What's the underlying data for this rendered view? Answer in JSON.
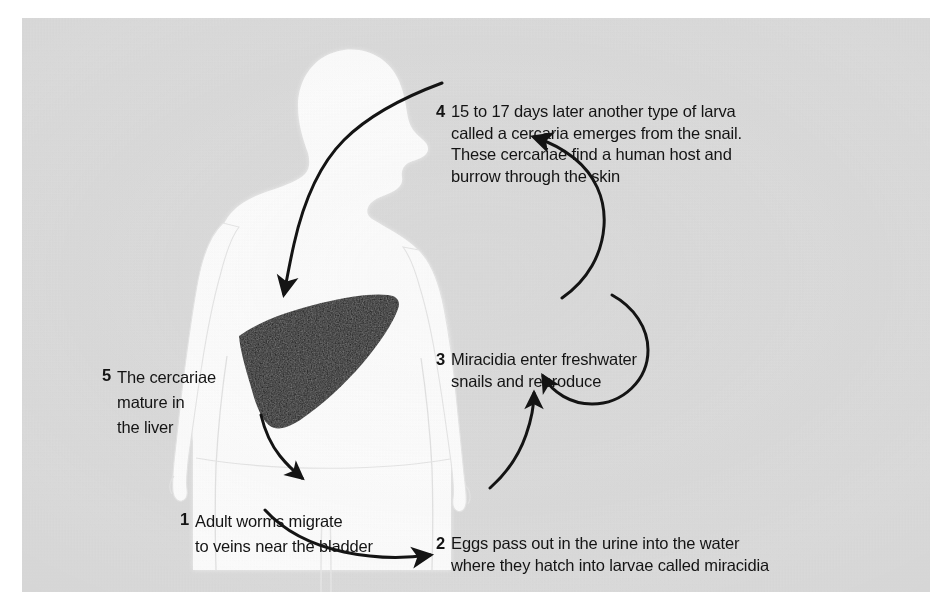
{
  "figure": {
    "background_color": "#ffffff",
    "panel_color": "#dcdcdc",
    "ink_color": "#141414",
    "silhouette_color": "#fdfdfd",
    "organ_color": "#111111"
  },
  "steps": [
    {
      "number": "1",
      "lines": [
        "Adult worms migrate",
        "to veins near the bladder"
      ],
      "text": "Adult worms migrate to veins near the bladder"
    },
    {
      "number": "2",
      "lines": [
        "Eggs pass out in the urine into the water",
        "where they hatch into larvae called miracidia"
      ],
      "text": "Eggs pass out in the urine into the water where they hatch into larvae called miracidia"
    },
    {
      "number": "3",
      "lines": [
        "Miracidia enter freshwater",
        "snails and reproduce"
      ],
      "text": "Miracidia enter freshwater snails and reproduce"
    },
    {
      "number": "4",
      "lines": [
        "15 to 17 days later another type of larva",
        "called a cercaria emerges from the snail.",
        "These cercariae find a human host and",
        "burrow through the skin"
      ],
      "text": "15 to 17 days later another type of larva called a cercaria emerges from the snail. These cercariae find a human host and burrow through the skin"
    },
    {
      "number": "5",
      "lines": [
        "The cercariae",
        "mature in",
        "the liver"
      ],
      "text": "The cercariae mature in the liver"
    }
  ],
  "artwork": {
    "human_silhouette": "human-body-profile-silhouette",
    "organ": "liver-shape",
    "arrows": [
      {
        "name": "arrow-skin-to-liver",
        "from_step": "4",
        "to_step": "5"
      },
      {
        "name": "arrow-liver-to-bladder",
        "from_step": "5",
        "to_step": "1"
      },
      {
        "name": "arrow-bladder-to-water",
        "from_step": "1",
        "to_step": "2"
      },
      {
        "name": "arrow-water-to-snail",
        "from_step": "2",
        "to_step": "3"
      },
      {
        "name": "arrow-snail-reproduce-loop",
        "from_step": "3",
        "to_step": "3"
      },
      {
        "name": "arrow-snail-to-cercaria",
        "from_step": "3",
        "to_step": "4"
      }
    ]
  }
}
